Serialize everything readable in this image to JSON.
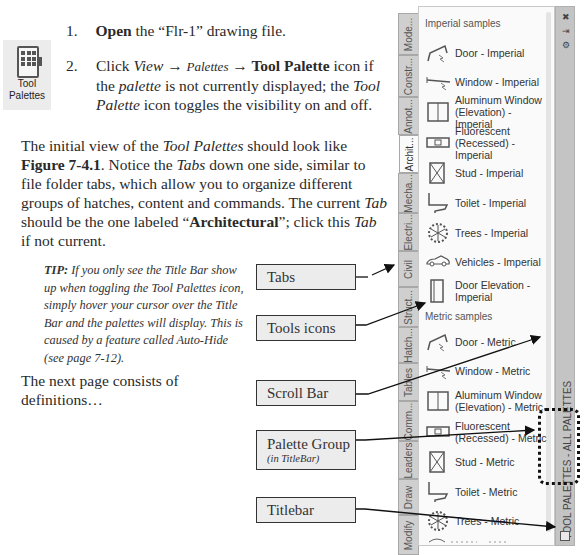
{
  "steps": [
    {
      "number": "1.",
      "bold": "Open",
      "text": " the “Flr-1” drawing file."
    },
    {
      "number": "2.",
      "parts": {
        "pre": "Click ",
        "view": "View",
        "arrow1": " → ",
        "palettes": "Palettes",
        "arrow2": " → ",
        "tool_palette": "Tool Palette",
        "mid1": " icon if the ",
        "palette": "palette",
        "mid2": " is not currently displayed; the ",
        "tool_palette_i": "Tool Palette",
        "end": " icon toggles the visibility on and off."
      }
    }
  ],
  "toolbar_icon": {
    "icon": "tool-palettes-icon",
    "label_line1": "Tool",
    "label_line2": "Palettes"
  },
  "intro": {
    "p1": "The initial view of the ",
    "tool_palettes": "Tool Palettes",
    "p2": " should look like ",
    "figure": "Figure 7-4.1",
    "p3": ". Notice the ",
    "tabs": "Tabs",
    "p4": " down one side, similar to file folder tabs, which allow you to organize different groups of hatches, content and commands. The current ",
    "tab": "Tab",
    "p5": " should be the one labeled “",
    "architectural": "Architectural",
    "p6": "”; click this ",
    "tab2": "Tab",
    "p7": " if not current."
  },
  "tip": {
    "label": "TIP:",
    "text": " If you only see the Title Bar show up when toggling the Tool Palettes icon, simply hover your cursor over the Title Bar and the palettes will display. This is caused by a feature called Auto-Hide (see page 7-12)."
  },
  "next_page": "The next page consists of definitions…",
  "callouts": [
    {
      "label": "Tabs"
    },
    {
      "label": "Tools icons"
    },
    {
      "label": "Scroll Bar"
    },
    {
      "label": "Palette Group",
      "sub": "(in TitleBar)"
    },
    {
      "label": "Titlebar"
    }
  ],
  "palette": {
    "title": "TOOL PALETTES - ALL PALETTES",
    "controls": [
      "✖",
      "⇥",
      "⚙"
    ],
    "tabs": [
      "Mode...",
      "Constr...",
      "Annot...",
      "Archit...",
      "Mecha...",
      "Electri...",
      "Civil",
      "Struct...",
      "Hatch...",
      "Tables",
      "Comm...",
      "Leaders",
      "Draw",
      "Modify"
    ],
    "active_tab": "Archit...",
    "sections": [
      {
        "title": "Imperial samples",
        "tools": [
          {
            "icon": "door-icon",
            "label": "Door - Imperial"
          },
          {
            "icon": "window-icon",
            "label": "Window - Imperial"
          },
          {
            "icon": "aluminum-window-icon",
            "label": "Aluminum Window (Elevation) - Imperial"
          },
          {
            "icon": "fluorescent-icon",
            "label": "Fluorescent (Recessed) - Imperial"
          },
          {
            "icon": "stud-icon",
            "label": "Stud - Imperial"
          },
          {
            "icon": "toilet-icon",
            "label": "Toilet - Imperial"
          },
          {
            "icon": "trees-icon",
            "label": "Trees - Imperial"
          },
          {
            "icon": "vehicles-icon",
            "label": "Vehicles - Imperial"
          },
          {
            "icon": "door-elevation-icon",
            "label": "Door Elevation - Imperial"
          }
        ]
      },
      {
        "title": "Metric samples",
        "tools": [
          {
            "icon": "door-icon",
            "label": "Door - Metric"
          },
          {
            "icon": "window-icon",
            "label": "Window - Metric"
          },
          {
            "icon": "aluminum-window-icon",
            "label": "Aluminum Window (Elevation) - Metric"
          },
          {
            "icon": "fluorescent-icon",
            "label": "Fluorescent (Recessed) - Metric"
          },
          {
            "icon": "stud-icon",
            "label": "Stud - Metric"
          },
          {
            "icon": "toilet-icon",
            "label": "Toilet - Metric"
          },
          {
            "icon": "trees-icon",
            "label": "Trees - Metric"
          }
        ]
      }
    ]
  }
}
